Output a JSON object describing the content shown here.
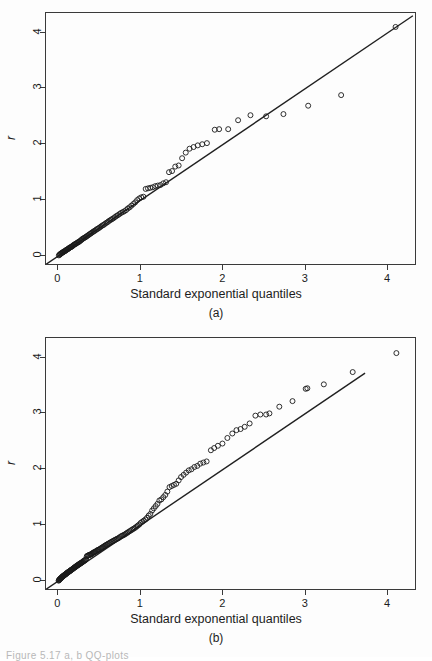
{
  "figure": {
    "caption_fragment": "Figure   5.17   a, b QQ-plots"
  },
  "panels": [
    {
      "id": "a",
      "caption": "(a)",
      "xlabel": "Standard exponential quantiles",
      "ylabel": "r",
      "xticks": [
        "0",
        "1",
        "2",
        "3",
        "4"
      ],
      "yticks": [
        "0",
        "1",
        "2",
        "3",
        "4"
      ],
      "frame": {
        "left": 45,
        "top": 12,
        "width": 371,
        "height": 253
      }
    },
    {
      "id": "b",
      "caption": "(b)",
      "xlabel": "Standard exponential quantiles",
      "ylabel": "r",
      "xticks": [
        "0",
        "1",
        "2",
        "3",
        "4"
      ],
      "yticks": [
        "0",
        "1",
        "2",
        "3",
        "4"
      ],
      "frame": {
        "left": 45,
        "top": 12,
        "width": 371,
        "height": 253
      }
    }
  ],
  "chart_data": [
    {
      "type": "scatter",
      "panel": "a",
      "title": "",
      "xlabel": "Standard exponential quantiles",
      "ylabel": "r",
      "xlim": [
        -0.15,
        4.35
      ],
      "ylim": [
        -0.18,
        4.35
      ],
      "xticks": [
        0,
        1,
        2,
        3,
        4
      ],
      "yticks": [
        0,
        1,
        2,
        3,
        4
      ],
      "grid": false,
      "legend": null,
      "marker": "open-circle",
      "reference_line": {
        "x": [
          -0.15,
          4.3
        ],
        "y": [
          -0.15,
          4.3
        ],
        "slope": 1,
        "intercept": 0
      },
      "points": [
        [
          0.006,
          0.01
        ],
        [
          0.013,
          0.02
        ],
        [
          0.019,
          0.03
        ],
        [
          0.026,
          0.035
        ],
        [
          0.033,
          0.045
        ],
        [
          0.04,
          0.05
        ],
        [
          0.047,
          0.06
        ],
        [
          0.054,
          0.065
        ],
        [
          0.061,
          0.07
        ],
        [
          0.068,
          0.08
        ],
        [
          0.076,
          0.085
        ],
        [
          0.083,
          0.09
        ],
        [
          0.091,
          0.1
        ],
        [
          0.098,
          0.11
        ],
        [
          0.106,
          0.115
        ],
        [
          0.114,
          0.12
        ],
        [
          0.122,
          0.13
        ],
        [
          0.13,
          0.14
        ],
        [
          0.138,
          0.15
        ],
        [
          0.147,
          0.155
        ],
        [
          0.155,
          0.16
        ],
        [
          0.164,
          0.17
        ],
        [
          0.173,
          0.18
        ],
        [
          0.181,
          0.19
        ],
        [
          0.19,
          0.2
        ],
        [
          0.2,
          0.21
        ],
        [
          0.209,
          0.215
        ],
        [
          0.218,
          0.225
        ],
        [
          0.228,
          0.235
        ],
        [
          0.238,
          0.245
        ],
        [
          0.247,
          0.25
        ],
        [
          0.257,
          0.26
        ],
        [
          0.268,
          0.275
        ],
        [
          0.278,
          0.285
        ],
        [
          0.288,
          0.3
        ],
        [
          0.299,
          0.31
        ],
        [
          0.31,
          0.32
        ],
        [
          0.321,
          0.33
        ],
        [
          0.332,
          0.34
        ],
        [
          0.343,
          0.35
        ],
        [
          0.355,
          0.365
        ],
        [
          0.367,
          0.375
        ],
        [
          0.379,
          0.39
        ],
        [
          0.391,
          0.4
        ],
        [
          0.403,
          0.415
        ],
        [
          0.416,
          0.425
        ],
        [
          0.428,
          0.44
        ],
        [
          0.441,
          0.45
        ],
        [
          0.455,
          0.465
        ],
        [
          0.468,
          0.48
        ],
        [
          0.482,
          0.49
        ],
        [
          0.496,
          0.505
        ],
        [
          0.51,
          0.52
        ],
        [
          0.524,
          0.535
        ],
        [
          0.539,
          0.55
        ],
        [
          0.554,
          0.56
        ],
        [
          0.569,
          0.58
        ],
        [
          0.585,
          0.595
        ],
        [
          0.601,
          0.61
        ],
        [
          0.617,
          0.63
        ],
        [
          0.634,
          0.645
        ],
        [
          0.651,
          0.66
        ],
        [
          0.668,
          0.675
        ],
        [
          0.686,
          0.695
        ],
        [
          0.704,
          0.715
        ],
        [
          0.722,
          0.73
        ],
        [
          0.741,
          0.75
        ],
        [
          0.76,
          0.77
        ],
        [
          0.78,
          0.785
        ],
        [
          0.8,
          0.8
        ],
        [
          0.821,
          0.82
        ],
        [
          0.842,
          0.85
        ],
        [
          0.864,
          0.87
        ],
        [
          0.886,
          0.9
        ],
        [
          0.909,
          0.93
        ],
        [
          0.932,
          0.96
        ],
        [
          0.956,
          1.0
        ],
        [
          0.981,
          1.03
        ],
        [
          1.006,
          1.05
        ],
        [
          1.032,
          1.06
        ],
        [
          1.059,
          1.2
        ],
        [
          1.087,
          1.21
        ],
        [
          1.115,
          1.22
        ],
        [
          1.145,
          1.23
        ],
        [
          1.175,
          1.25
        ],
        [
          1.206,
          1.26
        ],
        [
          1.238,
          1.27
        ],
        [
          1.272,
          1.3
        ],
        [
          1.306,
          1.32
        ],
        [
          1.342,
          1.5
        ],
        [
          1.379,
          1.52
        ],
        [
          1.418,
          1.6
        ],
        [
          1.459,
          1.62
        ],
        [
          1.501,
          1.75
        ],
        [
          1.545,
          1.85
        ],
        [
          1.591,
          1.92
        ],
        [
          1.64,
          1.95
        ],
        [
          1.691,
          1.98
        ],
        [
          1.745,
          2.0
        ],
        [
          1.802,
          2.02
        ],
        [
          1.897,
          2.26
        ],
        [
          1.95,
          2.27
        ],
        [
          2.06,
          2.27
        ],
        [
          2.18,
          2.43
        ],
        [
          2.33,
          2.52
        ],
        [
          2.52,
          2.5
        ],
        [
          2.73,
          2.54
        ],
        [
          3.03,
          2.69
        ],
        [
          3.43,
          2.88
        ],
        [
          4.09,
          4.1
        ]
      ]
    },
    {
      "type": "scatter",
      "panel": "b",
      "title": "",
      "xlabel": "Standard exponential quantiles",
      "ylabel": "r",
      "xlim": [
        -0.15,
        4.35
      ],
      "ylim": [
        -0.18,
        4.35
      ],
      "xticks": [
        0,
        1,
        2,
        3,
        4
      ],
      "yticks": [
        0,
        1,
        2,
        3,
        4
      ],
      "grid": false,
      "legend": null,
      "marker": "open-circle",
      "reference_line": {
        "x": [
          -0.15,
          3.72
        ],
        "y": [
          -0.15,
          3.72
        ],
        "slope": 1,
        "intercept": 0
      },
      "points": [
        [
          0.003,
          0.005
        ],
        [
          0.007,
          0.012
        ],
        [
          0.011,
          0.02
        ],
        [
          0.015,
          0.028
        ],
        [
          0.019,
          0.035
        ],
        [
          0.023,
          0.04
        ],
        [
          0.027,
          0.045
        ],
        [
          0.031,
          0.05
        ],
        [
          0.035,
          0.055
        ],
        [
          0.039,
          0.06
        ],
        [
          0.043,
          0.07
        ],
        [
          0.047,
          0.075
        ],
        [
          0.052,
          0.08
        ],
        [
          0.056,
          0.085
        ],
        [
          0.06,
          0.09
        ],
        [
          0.065,
          0.095
        ],
        [
          0.069,
          0.1
        ],
        [
          0.074,
          0.105
        ],
        [
          0.078,
          0.11
        ],
        [
          0.083,
          0.115
        ],
        [
          0.088,
          0.12
        ],
        [
          0.092,
          0.125
        ],
        [
          0.097,
          0.13
        ],
        [
          0.102,
          0.14
        ],
        [
          0.107,
          0.145
        ],
        [
          0.112,
          0.15
        ],
        [
          0.117,
          0.155
        ],
        [
          0.122,
          0.16
        ],
        [
          0.127,
          0.165
        ],
        [
          0.132,
          0.17
        ],
        [
          0.138,
          0.175
        ],
        [
          0.143,
          0.18
        ],
        [
          0.148,
          0.19
        ],
        [
          0.154,
          0.195
        ],
        [
          0.159,
          0.2
        ],
        [
          0.165,
          0.205
        ],
        [
          0.171,
          0.21
        ],
        [
          0.176,
          0.22
        ],
        [
          0.182,
          0.225
        ],
        [
          0.188,
          0.23
        ],
        [
          0.194,
          0.24
        ],
        [
          0.2,
          0.245
        ],
        [
          0.206,
          0.25
        ],
        [
          0.212,
          0.26
        ],
        [
          0.218,
          0.265
        ],
        [
          0.225,
          0.27
        ],
        [
          0.231,
          0.28
        ],
        [
          0.237,
          0.285
        ],
        [
          0.244,
          0.29
        ],
        [
          0.25,
          0.3
        ],
        [
          0.257,
          0.305
        ],
        [
          0.264,
          0.31
        ],
        [
          0.271,
          0.32
        ],
        [
          0.278,
          0.325
        ],
        [
          0.285,
          0.33
        ],
        [
          0.292,
          0.34
        ],
        [
          0.299,
          0.35
        ],
        [
          0.306,
          0.355
        ],
        [
          0.313,
          0.36
        ],
        [
          0.321,
          0.37
        ],
        [
          0.328,
          0.38
        ],
        [
          0.336,
          0.39
        ],
        [
          0.344,
          0.44
        ],
        [
          0.352,
          0.45
        ],
        [
          0.359,
          0.455
        ],
        [
          0.368,
          0.46
        ],
        [
          0.376,
          0.465
        ],
        [
          0.384,
          0.47
        ],
        [
          0.392,
          0.475
        ],
        [
          0.401,
          0.48
        ],
        [
          0.409,
          0.49
        ],
        [
          0.418,
          0.5
        ],
        [
          0.427,
          0.51
        ],
        [
          0.436,
          0.515
        ],
        [
          0.445,
          0.52
        ],
        [
          0.454,
          0.53
        ],
        [
          0.464,
          0.54
        ],
        [
          0.473,
          0.55
        ],
        [
          0.483,
          0.555
        ],
        [
          0.492,
          0.56
        ],
        [
          0.502,
          0.57
        ],
        [
          0.512,
          0.58
        ],
        [
          0.522,
          0.59
        ],
        [
          0.533,
          0.6
        ],
        [
          0.543,
          0.61
        ],
        [
          0.554,
          0.62
        ],
        [
          0.564,
          0.63
        ],
        [
          0.575,
          0.64
        ],
        [
          0.586,
          0.65
        ],
        [
          0.598,
          0.66
        ],
        [
          0.609,
          0.67
        ],
        [
          0.621,
          0.68
        ],
        [
          0.632,
          0.69
        ],
        [
          0.644,
          0.7
        ],
        [
          0.656,
          0.71
        ],
        [
          0.669,
          0.72
        ],
        [
          0.681,
          0.73
        ],
        [
          0.694,
          0.74
        ],
        [
          0.707,
          0.75
        ],
        [
          0.72,
          0.76
        ],
        [
          0.733,
          0.77
        ],
        [
          0.747,
          0.785
        ],
        [
          0.761,
          0.8
        ],
        [
          0.775,
          0.81
        ],
        [
          0.789,
          0.82
        ],
        [
          0.803,
          0.83
        ],
        [
          0.818,
          0.845
        ],
        [
          0.833,
          0.86
        ],
        [
          0.848,
          0.875
        ],
        [
          0.864,
          0.89
        ],
        [
          0.88,
          0.905
        ],
        [
          0.896,
          0.92
        ],
        [
          0.912,
          0.935
        ],
        [
          0.929,
          0.95
        ],
        [
          0.946,
          0.97
        ],
        [
          0.963,
          0.99
        ],
        [
          0.981,
          1.01
        ],
        [
          0.999,
          1.04
        ],
        [
          1.018,
          1.06
        ],
        [
          1.036,
          1.08
        ],
        [
          1.056,
          1.1
        ],
        [
          1.075,
          1.13
        ],
        [
          1.095,
          1.17
        ],
        [
          1.116,
          1.2
        ],
        [
          1.137,
          1.26
        ],
        [
          1.158,
          1.3
        ],
        [
          1.18,
          1.34
        ],
        [
          1.202,
          1.38
        ],
        [
          1.225,
          1.44
        ],
        [
          1.249,
          1.46
        ],
        [
          1.273,
          1.5
        ],
        [
          1.297,
          1.54
        ],
        [
          1.322,
          1.6
        ],
        [
          1.348,
          1.68
        ],
        [
          1.375,
          1.7
        ],
        [
          1.402,
          1.72
        ],
        [
          1.43,
          1.74
        ],
        [
          1.459,
          1.8
        ],
        [
          1.488,
          1.86
        ],
        [
          1.519,
          1.9
        ],
        [
          1.55,
          1.94
        ],
        [
          1.582,
          1.98
        ],
        [
          1.615,
          2.0
        ],
        [
          1.65,
          2.04
        ],
        [
          1.685,
          2.06
        ],
        [
          1.721,
          2.1
        ],
        [
          1.759,
          2.12
        ],
        [
          1.798,
          2.14
        ],
        [
          1.85,
          2.34
        ],
        [
          1.89,
          2.38
        ],
        [
          1.935,
          2.42
        ],
        [
          1.99,
          2.46
        ],
        [
          2.05,
          2.56
        ],
        [
          2.11,
          2.64
        ],
        [
          2.16,
          2.7
        ],
        [
          2.21,
          2.72
        ],
        [
          2.26,
          2.76
        ],
        [
          2.32,
          2.82
        ],
        [
          2.39,
          2.96
        ],
        [
          2.45,
          2.98
        ],
        [
          2.52,
          2.98
        ],
        [
          2.56,
          3.0
        ],
        [
          2.68,
          3.12
        ],
        [
          2.84,
          3.22
        ],
        [
          3.0,
          3.44
        ],
        [
          3.02,
          3.45
        ],
        [
          3.22,
          3.52
        ],
        [
          3.57,
          3.74
        ],
        [
          4.1,
          4.08
        ]
      ]
    }
  ]
}
